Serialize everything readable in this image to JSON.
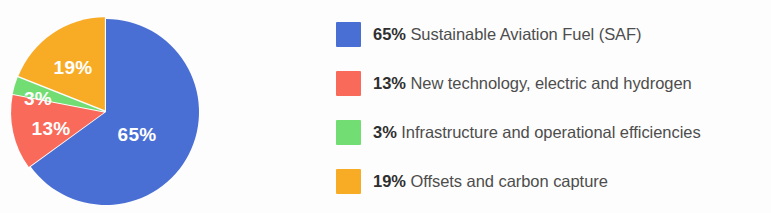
{
  "chart_data": {
    "type": "pie",
    "title": "",
    "subtitle": "",
    "categories": [
      "Sustainable Aviation Fuel (SAF)",
      "New technology, electric and hydrogen",
      "Infrastructure and operational efficiencies",
      "Offsets and carbon capture"
    ],
    "values": [
      65,
      13,
      3,
      19
    ],
    "value_labels": [
      "65%",
      "13%",
      "3%",
      "19%"
    ],
    "colors": [
      "#4a6fd4",
      "#f96a5a",
      "#72dd72",
      "#f8ac26"
    ],
    "units": "percent",
    "start_angle_deg": 0,
    "direction": "clockwise",
    "legend_position": "right",
    "grid": false,
    "slice_labels_inside": true,
    "slice_label_color": "#ffffff",
    "separator_color": "#ffffff"
  },
  "pie": {
    "slices": [
      {
        "name": "saf",
        "label": "65%",
        "value": 65,
        "color": "#4a6fd4",
        "label_x": 137,
        "label_y": 135
      },
      {
        "name": "new-technology",
        "label": "13%",
        "value": 13,
        "color": "#f96a5a",
        "label_x": 51,
        "label_y": 129
      },
      {
        "name": "infrastructure",
        "label": "3%",
        "value": 3,
        "color": "#72dd72",
        "label_x": 38,
        "label_y": 99
      },
      {
        "name": "offsets",
        "label": "19%",
        "value": 19,
        "color": "#f8ac26",
        "label_x": 73,
        "label_y": 68
      }
    ]
  },
  "legend": {
    "items": [
      {
        "percent": "65%",
        "description": " Sustainable Aviation Fuel (SAF)",
        "color": "#4a6fd4",
        "swatch_name": "legend-swatch-saf"
      },
      {
        "percent": "13%",
        "description": " New technology, electric and hydrogen",
        "color": "#f96a5a",
        "swatch_name": "legend-swatch-new-technology"
      },
      {
        "percent": "3%",
        "description": " Infrastructure and operational efficiencies",
        "color": "#72dd72",
        "swatch_name": "legend-swatch-infrastructure"
      },
      {
        "percent": "19%",
        "description": " Offsets and carbon capture",
        "color": "#f8ac26",
        "swatch_name": "legend-swatch-offsets"
      }
    ]
  }
}
